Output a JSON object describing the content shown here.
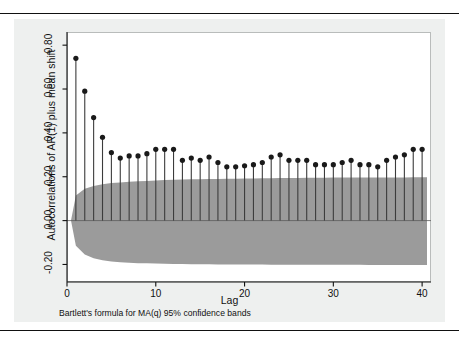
{
  "figure": {
    "background_color": "#eef0ef",
    "plot_background_color": "#ffffff",
    "band_color": "#9b9b9b",
    "stem_color": "#3c3c3c",
    "marker_color": "#1a1a1a"
  },
  "caption": "Bartlett's formula for MA(q) 95% confidence bands",
  "chart_data": {
    "type": "bar",
    "subtype": "autocorrelation-correlogram",
    "title": "",
    "subtitle": "",
    "xlabel": "Lag",
    "ylabel": "Autocorrelations of AR(1) plus mean shift",
    "xlim": [
      0,
      41
    ],
    "ylim": [
      -0.28,
      0.86
    ],
    "grid": false,
    "legend": null,
    "xticks": [
      0,
      10,
      20,
      30,
      40
    ],
    "xticklabels": [
      "0",
      "10",
      "20",
      "30",
      "40"
    ],
    "yticks": [
      -0.2,
      0.0,
      0.2,
      0.4,
      0.6,
      0.8
    ],
    "yticklabels": [
      "-0.20",
      "0.00",
      "0.20",
      "0.40",
      "0.60",
      "0.80"
    ],
    "categories": [
      1,
      2,
      3,
      4,
      5,
      6,
      7,
      8,
      9,
      10,
      11,
      12,
      13,
      14,
      15,
      16,
      17,
      18,
      19,
      20,
      21,
      22,
      23,
      24,
      25,
      26,
      27,
      28,
      29,
      30,
      31,
      32,
      33,
      34,
      35,
      36,
      37,
      38,
      39,
      40
    ],
    "values": [
      0.74,
      0.59,
      0.47,
      0.38,
      0.31,
      0.285,
      0.295,
      0.295,
      0.305,
      0.325,
      0.325,
      0.325,
      0.275,
      0.285,
      0.275,
      0.29,
      0.265,
      0.245,
      0.245,
      0.25,
      0.255,
      0.265,
      0.29,
      0.3,
      0.275,
      0.275,
      0.275,
      0.255,
      0.255,
      0.255,
      0.265,
      0.275,
      0.255,
      0.255,
      0.245,
      0.275,
      0.29,
      0.3,
      0.325,
      0.325
    ],
    "confidence_band": {
      "label": "Bartlett's formula for MA(q) 95% confidence bands",
      "upper": [
        0.115,
        0.145,
        0.158,
        0.166,
        0.171,
        0.174,
        0.177,
        0.179,
        0.181,
        0.183,
        0.185,
        0.186,
        0.187,
        0.188,
        0.189,
        0.19,
        0.19,
        0.191,
        0.191,
        0.192,
        0.192,
        0.193,
        0.193,
        0.194,
        0.194,
        0.194,
        0.195,
        0.195,
        0.195,
        0.196,
        0.196,
        0.196,
        0.196,
        0.197,
        0.197,
        0.197,
        0.197,
        0.197,
        0.198,
        0.198
      ],
      "lower": [
        -0.115,
        -0.155,
        -0.172,
        -0.181,
        -0.187,
        -0.19,
        -0.192,
        -0.194,
        -0.195,
        -0.196,
        -0.197,
        -0.198,
        -0.198,
        -0.199,
        -0.199,
        -0.199,
        -0.2,
        -0.2,
        -0.2,
        -0.2,
        -0.2,
        -0.2,
        -0.201,
        -0.201,
        -0.201,
        -0.201,
        -0.201,
        -0.201,
        -0.201,
        -0.201,
        -0.201,
        -0.201,
        -0.201,
        -0.202,
        -0.202,
        -0.202,
        -0.202,
        -0.202,
        -0.202,
        -0.202
      ]
    }
  }
}
